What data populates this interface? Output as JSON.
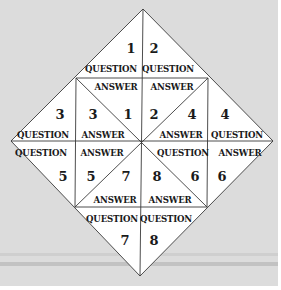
{
  "diagram": {
    "type": "fortune-teller-folding-diagram",
    "colors": {
      "background": "#dcdcdc",
      "band": "#c4c4c4",
      "paper": "#ffffff",
      "line": "#3a3a3a",
      "text": "#1a1a1a"
    },
    "words": {
      "question": "QUESTION",
      "answer": "ANSWER"
    },
    "cells": [
      {
        "id": "top-left-question",
        "number": "1",
        "word": "QUESTION"
      },
      {
        "id": "top-right-question",
        "number": "2",
        "word": "QUESTION"
      },
      {
        "id": "top-left-answer",
        "word": "ANSWER"
      },
      {
        "id": "top-right-answer",
        "word": "ANSWER"
      },
      {
        "id": "left-upper-question",
        "number": "3",
        "word": "QUESTION"
      },
      {
        "id": "inner-upper-left-answer",
        "numbers": [
          "3",
          "1"
        ],
        "word": "ANSWER"
      },
      {
        "id": "inner-upper-right-answer",
        "numbers": [
          "2",
          "4"
        ],
        "word": "ANSWER"
      },
      {
        "id": "right-upper-question",
        "number": "4",
        "word": "QUESTION"
      },
      {
        "id": "left-lower-question",
        "number": "5",
        "word": "QUESTION"
      },
      {
        "id": "inner-lower-left-answer",
        "numbers": [
          "5",
          "7"
        ],
        "word": "ANSWER"
      },
      {
        "id": "inner-lower-right-question",
        "numbers": [
          "8",
          "6"
        ],
        "word": "QUESTION"
      },
      {
        "id": "right-lower-answer",
        "number": "6",
        "word": "ANSWER"
      },
      {
        "id": "bottom-left-answer",
        "word": "ANSWER"
      },
      {
        "id": "bottom-right-answer",
        "word": "ANSWER"
      },
      {
        "id": "bottom-left-question",
        "number": "7",
        "word": "QUESTION"
      },
      {
        "id": "bottom-right-question",
        "number": "8",
        "word": "QUESTION"
      }
    ],
    "labels": {
      "n1": "1",
      "n2": "2",
      "q_top_l": "QUESTION",
      "q_top_r": "QUESTION",
      "a_top_l": "ANSWER",
      "a_top_r": "ANSWER",
      "n3_left": "3",
      "n3_inner": "3",
      "n1_inner": "1",
      "n2_inner": "2",
      "n4_inner": "4",
      "n4_right": "4",
      "q_left_up": "QUESTION",
      "a_inner_ul": "ANSWER",
      "a_inner_ur": "ANSWER",
      "q_right_up": "QUESTION",
      "q_left_low": "QUESTION",
      "a_inner_ll": "ANSWER",
      "q_inner_lr": "QUESTION",
      "a_right_low": "ANSWER",
      "n5_left": "5",
      "n5_inner": "5",
      "n7_inner": "7",
      "n8_inner": "8",
      "n6_inner": "6",
      "n6_right": "6",
      "a_bot_l": "ANSWER",
      "a_bot_r": "ANSWER",
      "q_bot_l": "QUESTION",
      "q_bot_r": "QUESTION",
      "n7": "7",
      "n8": "8"
    }
  }
}
